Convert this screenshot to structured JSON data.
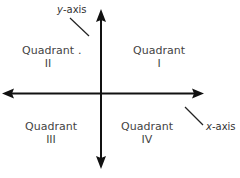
{
  "diagram": {
    "axes": {
      "y_label_var": "y",
      "y_label_rest": "-axis",
      "x_label_var": "x",
      "x_label_rest": "-axis"
    },
    "quadrants": [
      {
        "name": "Quadrant",
        "numeral": "I"
      },
      {
        "name": "Quadrant",
        "numeral": "II"
      },
      {
        "name": "Quadrant",
        "numeral": "III"
      },
      {
        "name": "Quadrant",
        "numeral": "IV"
      }
    ],
    "stray_mark": ".",
    "colors": {
      "axis": "#111111",
      "text": "#444444",
      "background": "#ffffff"
    }
  }
}
